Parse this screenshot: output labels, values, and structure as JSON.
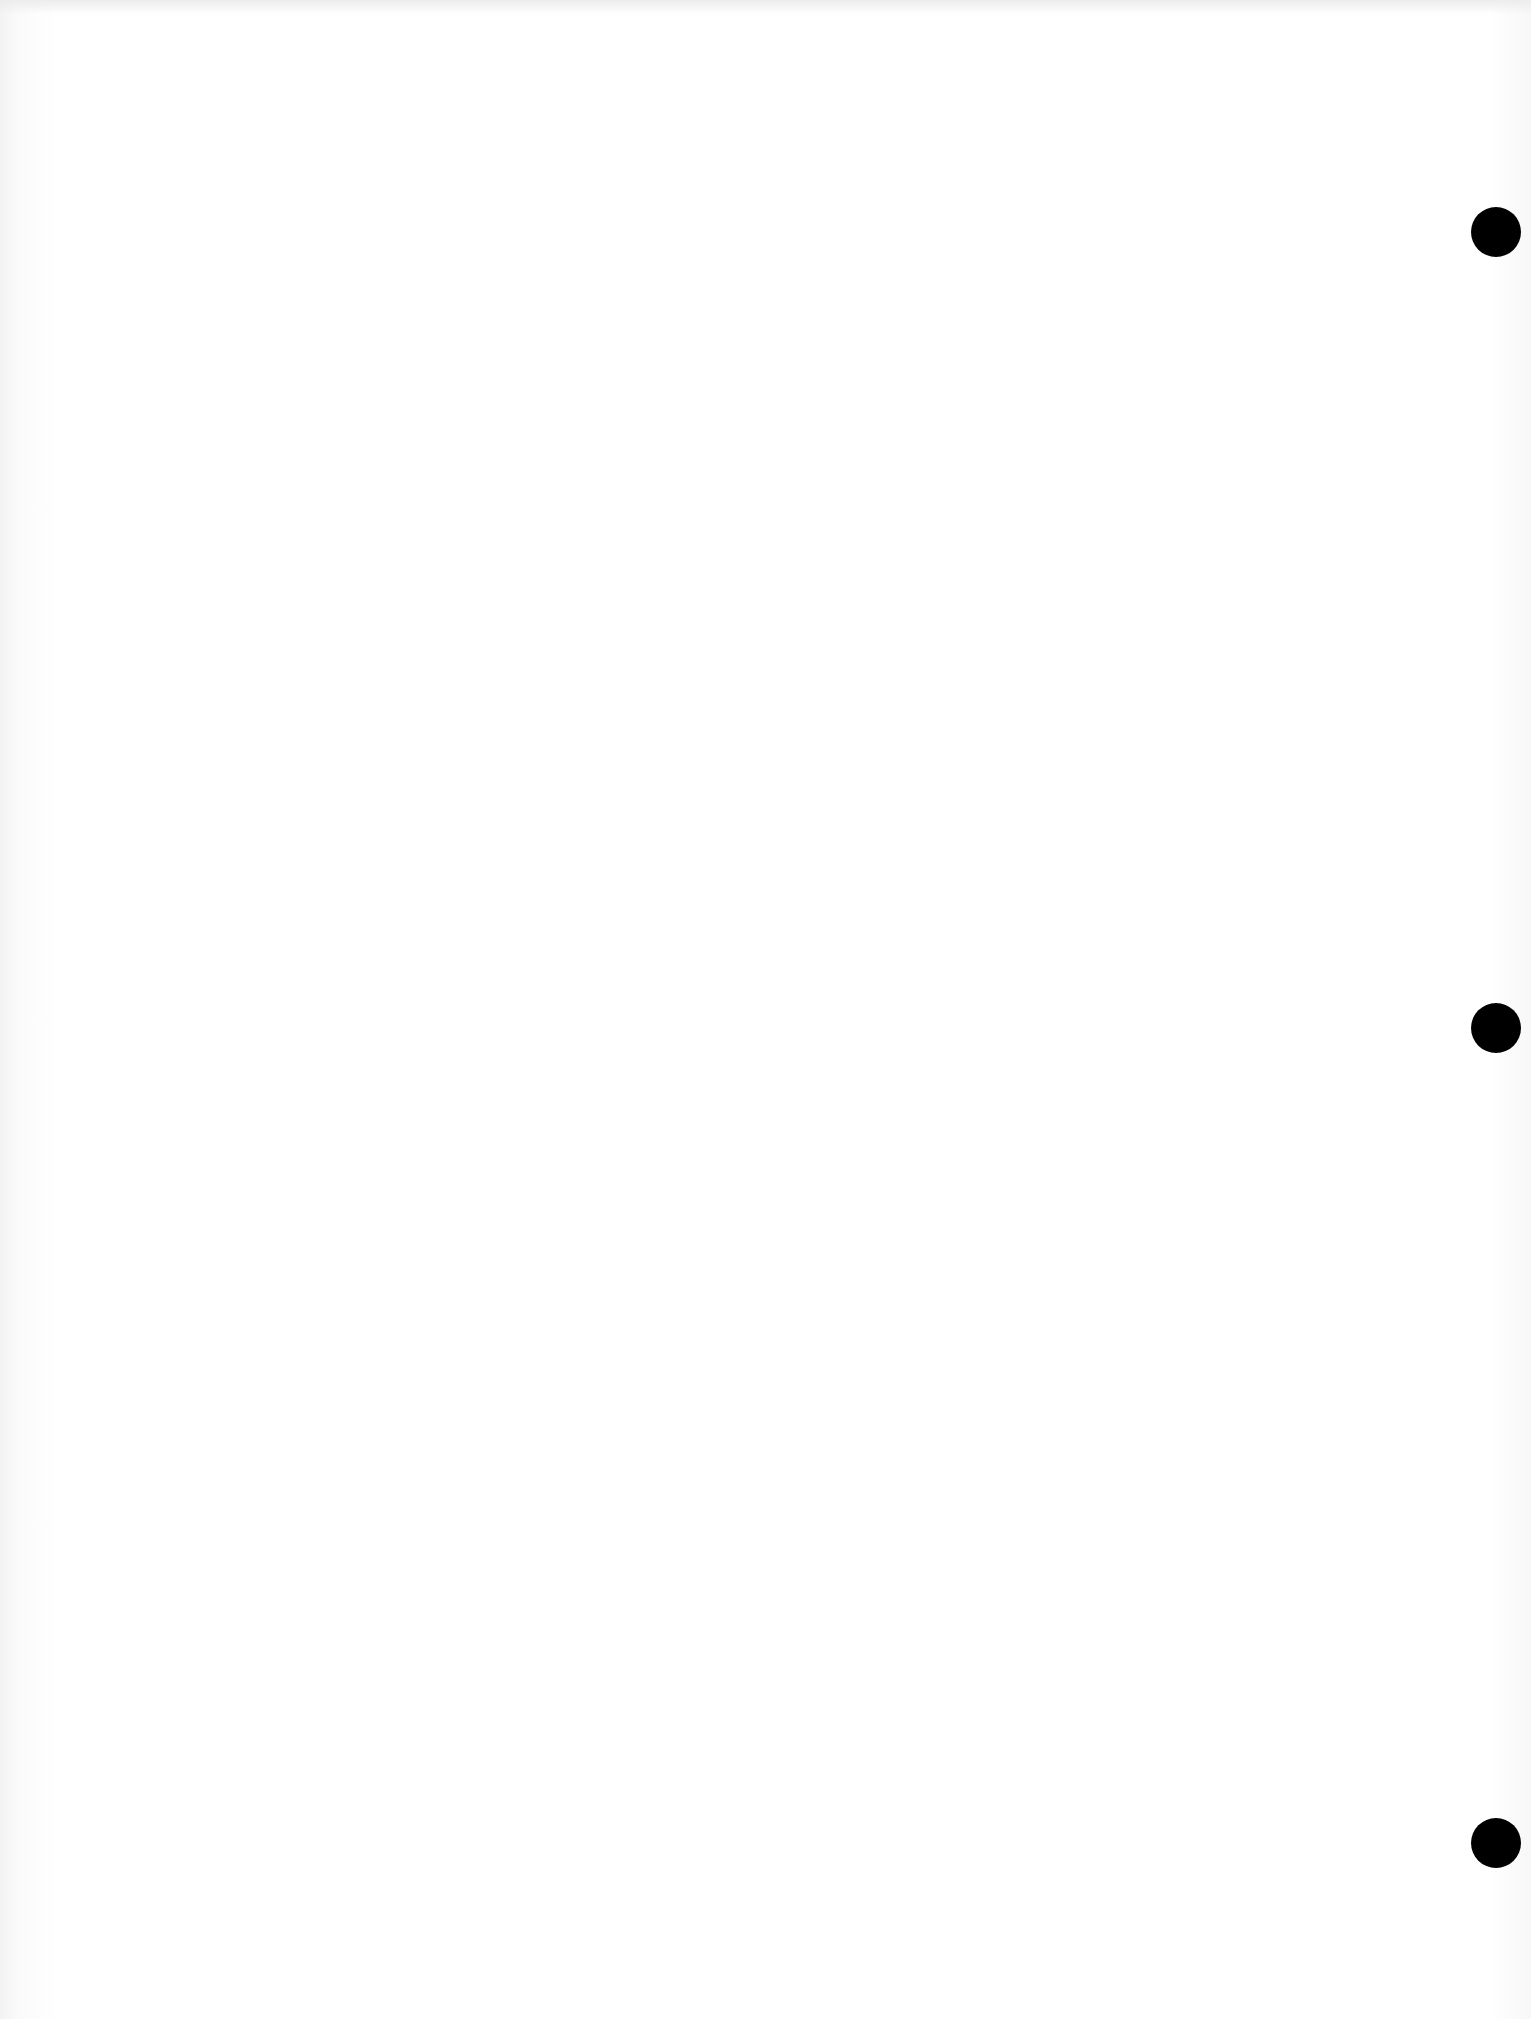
{
  "page": {
    "type": "blank-scanned-page",
    "background_color": "#ffffff",
    "text": ""
  },
  "punch_holes": [
    {
      "name": "top",
      "x": 1496,
      "y": 232,
      "diameter": 50,
      "color": "#000000"
    },
    {
      "name": "middle",
      "x": 1496,
      "y": 1028,
      "diameter": 50,
      "color": "#000000"
    },
    {
      "name": "bottom",
      "x": 1496,
      "y": 1843,
      "diameter": 50,
      "color": "#000000"
    }
  ]
}
